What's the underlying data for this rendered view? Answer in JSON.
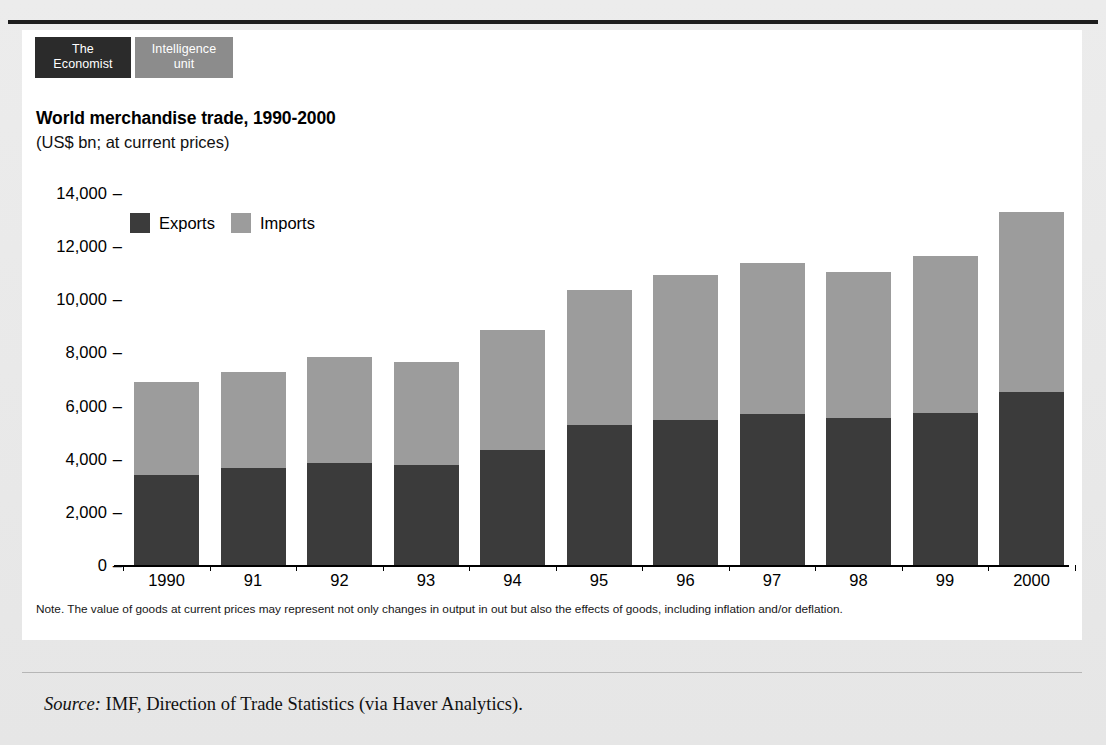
{
  "brand": {
    "economist_line1": "The",
    "economist_line2": "Economist",
    "eiu_line1": "Intelligence",
    "eiu_line2": "unit"
  },
  "note": "Note. The value of goods at current prices may represent not only changes in output in out but also the effects of goods, including inflation and/or deflation.",
  "source": {
    "label": "Source:",
    "text": " IMF, Direction of Trade Statistics (via Haver Analytics)."
  },
  "colors": {
    "exports": "#3b3b3b",
    "imports": "#9c9c9c",
    "badge_dark": "#2b2b2b",
    "badge_gray": "#8c8c8c",
    "panel": "#ffffff",
    "page": "#e9e9e9"
  },
  "chart_data": {
    "type": "bar",
    "stacked": true,
    "title": "World merchandise trade, 1990-2000",
    "subtitle": "(US$ bn; at current prices)",
    "xlabel": "",
    "ylabel": "",
    "ylim": [
      0,
      14000
    ],
    "yticks": [
      0,
      2000,
      4000,
      6000,
      8000,
      10000,
      12000,
      14000
    ],
    "ytick_labels": [
      "0",
      "2,000",
      "4,000",
      "6,000",
      "8,000",
      "10,000",
      "12,000",
      "14,000"
    ],
    "grid": false,
    "legend_position": "top-left-inside",
    "categories": [
      "1990",
      "91",
      "92",
      "93",
      "94",
      "95",
      "96",
      "97",
      "98",
      "99",
      "2000"
    ],
    "series": [
      {
        "name": "Exports",
        "color": "#3b3b3b",
        "values": [
          3390,
          3650,
          3840,
          3770,
          4330,
          5270,
          5460,
          5690,
          5540,
          5730,
          6520
        ]
      },
      {
        "name": "Imports",
        "color": "#9c9c9c",
        "values": [
          3490,
          3620,
          3990,
          3880,
          4520,
          5090,
          5470,
          5680,
          5490,
          5910,
          6750
        ]
      }
    ],
    "totals": [
      6880,
      7270,
      7830,
      7650,
      8850,
      10360,
      10930,
      11370,
      11030,
      11640,
      13270
    ]
  }
}
